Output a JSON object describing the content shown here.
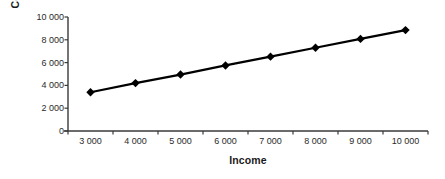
{
  "chart_data": {
    "type": "line",
    "title": "",
    "xlabel": "Income",
    "ylabel": "Consumption",
    "x": [
      3000,
      4000,
      5000,
      6000,
      7000,
      8000,
      9000,
      10000
    ],
    "values": [
      3400,
      4200,
      4950,
      5750,
      6520,
      7300,
      8080,
      8850
    ],
    "series": [
      {
        "name": "Consumption",
        "values": [
          3400,
          4200,
          4950,
          5750,
          6520,
          7300,
          8080,
          8850
        ]
      }
    ],
    "x_tick_labels": [
      "3 000",
      "4 000",
      "5 000",
      "6 000",
      "7 000",
      "8 000",
      "9 000",
      "10 000"
    ],
    "y_tick_labels": [
      "0",
      "2 000",
      "4 000",
      "6 000",
      "8 000",
      "10 000"
    ],
    "y_ticks": [
      0,
      2000,
      4000,
      6000,
      8000,
      10000
    ],
    "ylim": [
      0,
      10000
    ],
    "xlim": [
      2500,
      10500
    ],
    "grid": false,
    "legend": false,
    "marker": "diamond",
    "line_color": "#000000",
    "marker_color": "#000000",
    "axis_color": "#3a3a3a",
    "background_color": "#ffffff"
  },
  "axes": {
    "y_title": "Consumption",
    "x_title": "Income"
  }
}
